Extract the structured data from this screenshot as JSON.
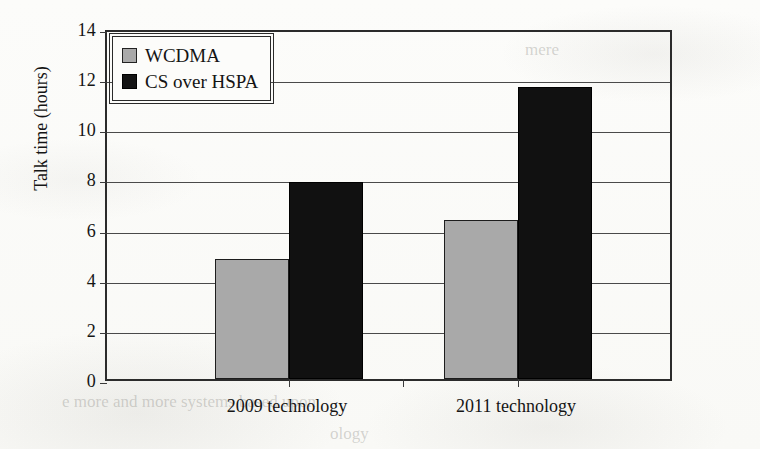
{
  "chart_data": {
    "type": "bar",
    "title": "",
    "xlabel": "",
    "ylabel": "Talk time (hours)",
    "categories": [
      "2009 technology",
      "2011 technology"
    ],
    "series": [
      {
        "name": "WCDMA",
        "color": "#a9a9a9",
        "values": [
          4.8,
          6.35
        ]
      },
      {
        "name": "CS over HSPA",
        "color": "#111111",
        "values": [
          7.85,
          11.65
        ]
      }
    ],
    "ylim": [
      0,
      14
    ],
    "ytick_step": 2,
    "yticks": [
      "14",
      "12",
      "10",
      "8",
      "6",
      "4",
      "2",
      "0"
    ],
    "grid": "horizontal",
    "legend_position": "top-left-inside"
  },
  "legend": {
    "items": [
      {
        "label": "WCDMA",
        "swatch": "gray-square-icon"
      },
      {
        "label": "CS over HSPA",
        "swatch": "black-square-icon"
      }
    ]
  },
  "artifacts": {
    "ghost_texts": [
      "mere",
      "e more and more systems based upon",
      "ology"
    ]
  }
}
